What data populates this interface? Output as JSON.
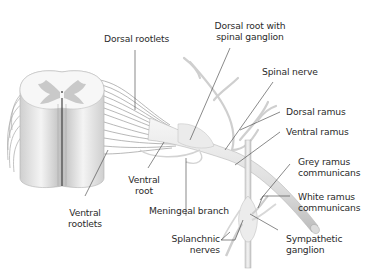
{
  "figure": {
    "colors": {
      "background": "#ffffff",
      "tissue_light": "#f2f2f2",
      "tissue_mid": "#d9d9d9",
      "grey_matter": "#c8c8c8",
      "leader_line": "#3a3a3a",
      "text": "#2b2b2b"
    },
    "labels": {
      "dorsal_rootlets": "Dorsal rootlets",
      "dorsal_root_ganglion_line1": "Dorsal root with",
      "dorsal_root_ganglion_line2": "spinal ganglion",
      "spinal_nerve": "Spinal nerve",
      "dorsal_ramus": "Dorsal ramus",
      "ventral_ramus": "Ventral ramus",
      "grey_ramus_line1": "Grey ramus",
      "grey_ramus_line2": "communicans",
      "white_ramus_line1": "White ramus",
      "white_ramus_line2": "communicans",
      "sympathetic_ganglion_line1": "Sympathetic",
      "sympathetic_ganglion_line2": "ganglion",
      "splanchnic_nerves_line1": "Splanchnic",
      "splanchnic_nerves_line2": "nerves",
      "meningeal_branch": "Meningeal branch",
      "ventral_root_line1": "Ventral",
      "ventral_root_line2": "root",
      "ventral_rootlets_line1": "Ventral",
      "ventral_rootlets_line2": "rootlets"
    }
  }
}
